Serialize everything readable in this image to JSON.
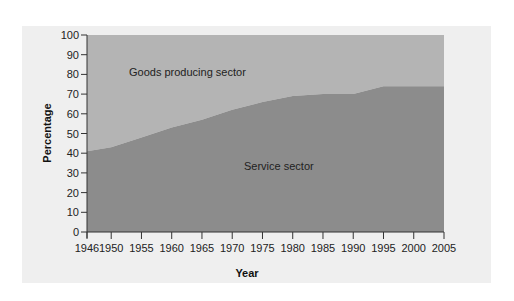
{
  "chart_data": {
    "type": "area",
    "title": "",
    "xlabel": "Year",
    "ylabel": "Percentage",
    "x": [
      1946,
      1950,
      1955,
      1960,
      1965,
      1970,
      1975,
      1980,
      1985,
      1990,
      1995,
      2000,
      2005
    ],
    "x_ticks": [
      "1946",
      "1950",
      "1955",
      "1960",
      "1965",
      "1970",
      "1975",
      "1980",
      "1985",
      "1990",
      "1995",
      "2000",
      "2005"
    ],
    "y_ticks": [
      "0",
      "10",
      "20",
      "30",
      "40",
      "50",
      "60",
      "70",
      "80",
      "90",
      "100"
    ],
    "ylim": [
      0,
      100
    ],
    "xlim": [
      1946,
      2005
    ],
    "grid": false,
    "stacked": true,
    "series": [
      {
        "name": "Service sector",
        "values": [
          41,
          43,
          48,
          53,
          57,
          62,
          66,
          69,
          70,
          70,
          74,
          74,
          74
        ],
        "color": "#8c8c8c"
      },
      {
        "name": "Goods producing sector",
        "values": [
          59,
          57,
          52,
          47,
          43,
          38,
          34,
          31,
          30,
          30,
          26,
          26,
          26
        ],
        "color": "#b4b4b4"
      }
    ],
    "annotations": [
      {
        "text": "Goods producing sector",
        "region": "upper area"
      },
      {
        "text": "Service sector",
        "region": "lower area"
      }
    ]
  },
  "labels": {
    "goods": "Goods producing sector",
    "service": "Service sector",
    "xlabel": "Year",
    "ylabel": "Percentage"
  }
}
